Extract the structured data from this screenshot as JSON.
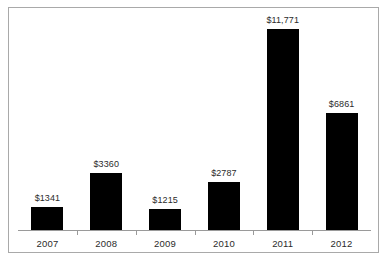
{
  "chart_data": {
    "type": "bar",
    "title": "",
    "subtitle": "",
    "xlabel": "",
    "ylabel": "",
    "categories": [
      "2007",
      "2008",
      "2009",
      "2010",
      "2011",
      "2012"
    ],
    "values": [
      1341,
      3360,
      1215,
      2787,
      11771,
      6861
    ],
    "value_labels": [
      "$1341",
      "$3360",
      "$1215",
      "$2787",
      "$11,771",
      "$6861"
    ],
    "ylim": [
      0,
      11771
    ],
    "grid": false,
    "legend": null,
    "y_axis_visible": false,
    "bar_color": "#000000",
    "axis_color": "#9a9a9a",
    "border_color": "#a9a9a9",
    "text_color": "#2b2b2b",
    "annotations": []
  }
}
